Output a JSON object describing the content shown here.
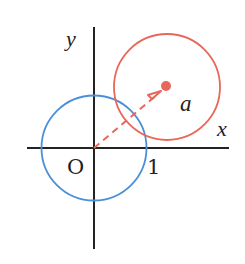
{
  "diagram": {
    "axes": {
      "x_label": "x",
      "y_label": "y",
      "origin_label": "O",
      "unit_tick_label": "1",
      "color": "#222222"
    },
    "unit_circle": {
      "label": "unit circle",
      "center": "O",
      "radius": 1,
      "color": "#4a90d9"
    },
    "shifted_circle": {
      "label": "circle centered at a",
      "center_label": "a",
      "radius": 1,
      "color": "#e8665a"
    },
    "vector": {
      "from": "O",
      "to": "a",
      "style": "dashed-arrow",
      "color": "#e8665a"
    },
    "point_a": {
      "label": "a",
      "color": "#e8665a"
    }
  }
}
